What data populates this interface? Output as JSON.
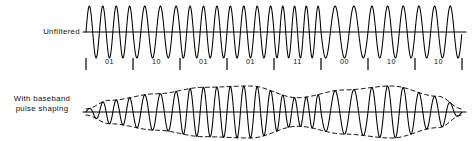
{
  "figure": {
    "title": "",
    "background_color": "#ffffff",
    "stroke_color": "#000000",
    "width": 476,
    "height": 141
  },
  "traces": {
    "unfiltered": {
      "label": "Unfiltered",
      "description": "constant-envelope frequency-shift-keyed carrier",
      "axis_y": 32,
      "axis_x_start": 83,
      "axis_x_end": 466,
      "amplitude": 26,
      "envelope": "constant"
    },
    "shaped": {
      "label_line1": "With  baseband",
      "label_line2": "pulse  shaping",
      "description": "same symbol stream with baseband pulse shaping applied; dashed curves show the smoothed envelope",
      "axis_y": 112,
      "axis_x_start": 83,
      "axis_x_end": 466,
      "amplitude": 26,
      "envelope": "pulse-shaped"
    }
  },
  "symbol_axis": {
    "tick_row_y": 62,
    "tick_positions": [
      86,
      133,
      180,
      227,
      274,
      321,
      368,
      415,
      462
    ],
    "symbol_labels": [
      "01",
      "10",
      "01",
      "01",
      "11",
      "00",
      "10",
      "10"
    ],
    "symbol_label_positions": [
      109.5,
      156.5,
      203.5,
      250.5,
      297.5,
      344.5,
      391.5,
      438.5
    ]
  },
  "chart_data": {
    "type": "line",
    "title": "",
    "xlabel": "",
    "ylabel": "",
    "grid": false,
    "legend": "none",
    "xlim": [
      83,
      466
    ],
    "ylim": [
      -1.15,
      1.15
    ],
    "symbols": [
      "01",
      "10",
      "01",
      "01",
      "11",
      "00",
      "10",
      "10"
    ],
    "symbol_boundaries": [
      86,
      133,
      180,
      227,
      274,
      321,
      368,
      415,
      462
    ],
    "series": [
      {
        "name": "Unfiltered",
        "carrier_cycles_per_symbol": [
          3.5,
          3.0,
          3.5,
          3.5,
          4.0,
          2.5,
          3.0,
          3.0
        ],
        "envelope_values": [
          1,
          1,
          1,
          1,
          1,
          1,
          1,
          1
        ],
        "note": "constant amplitude, abrupt phase/frequency transitions at symbol edges"
      },
      {
        "name": "With baseband pulse shaping",
        "carrier_cycles_per_symbol": [
          3.5,
          3.0,
          3.5,
          3.5,
          4.0,
          2.5,
          3.0,
          3.0
        ],
        "envelope_values": [
          0.45,
          0.7,
          0.95,
          1.0,
          0.55,
          0.85,
          1.0,
          0.6
        ],
        "note": "amplitude follows smooth raised-cosine-like envelope, dashed outline drawn above and below"
      }
    ]
  }
}
